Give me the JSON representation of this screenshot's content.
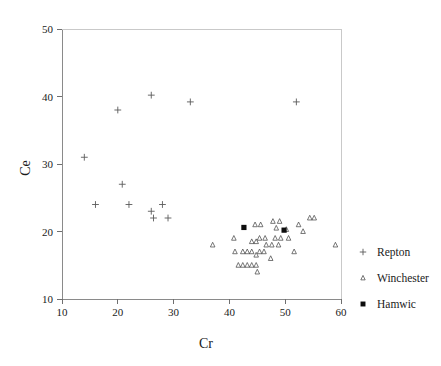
{
  "chart_data": {
    "type": "scatter",
    "title": "",
    "xlabel": "Cr",
    "ylabel": "Ce",
    "xlim": [
      10,
      60
    ],
    "ylim": [
      10,
      50
    ],
    "xticks": [
      10,
      20,
      30,
      40,
      50,
      60
    ],
    "yticks": [
      10,
      20,
      30,
      40,
      50
    ],
    "xtick_labels": [
      "10",
      "20",
      "30",
      "40",
      "50",
      "60"
    ],
    "ytick_labels": [
      "10",
      "20",
      "30",
      "40",
      "50"
    ],
    "grid": false,
    "legend_position": "right",
    "series": [
      {
        "name": "Repton",
        "marker": "plus",
        "color": "#5a5a5a",
        "points": [
          [
            14.0,
            31.0
          ],
          [
            16.0,
            24.0
          ],
          [
            20.0,
            38.0
          ],
          [
            20.8,
            27.0
          ],
          [
            22.0,
            24.0
          ],
          [
            26.0,
            40.2
          ],
          [
            26.0,
            23.0
          ],
          [
            26.4,
            22.0
          ],
          [
            28.0,
            24.0
          ],
          [
            29.0,
            22.0
          ],
          [
            33.0,
            39.2
          ],
          [
            52.0,
            39.2
          ]
        ]
      },
      {
        "name": "Winchester",
        "marker": "triangle",
        "color": "#4a4a4a",
        "points": [
          [
            37.0,
            18.0
          ],
          [
            40.8,
            19.0
          ],
          [
            41.0,
            17.0
          ],
          [
            41.6,
            15.0
          ],
          [
            42.4,
            15.0
          ],
          [
            42.4,
            17.0
          ],
          [
            43.2,
            15.0
          ],
          [
            43.2,
            17.0
          ],
          [
            44.0,
            15.0
          ],
          [
            44.0,
            17.0
          ],
          [
            44.0,
            18.5
          ],
          [
            44.6,
            21.0
          ],
          [
            44.8,
            15.0
          ],
          [
            44.8,
            16.5
          ],
          [
            44.8,
            18.5
          ],
          [
            45.0,
            14.0
          ],
          [
            45.4,
            17.0
          ],
          [
            45.4,
            19.0
          ],
          [
            45.6,
            21.0
          ],
          [
            46.2,
            17.0
          ],
          [
            46.4,
            19.0
          ],
          [
            46.6,
            18.0
          ],
          [
            47.4,
            16.0
          ],
          [
            47.6,
            18.0
          ],
          [
            47.8,
            21.5
          ],
          [
            48.2,
            19.0
          ],
          [
            48.4,
            20.5
          ],
          [
            48.8,
            18.0
          ],
          [
            49.0,
            21.5
          ],
          [
            49.2,
            19.0
          ],
          [
            50.2,
            20.3
          ],
          [
            50.6,
            19.0
          ],
          [
            51.6,
            17.0
          ],
          [
            52.4,
            21.0
          ],
          [
            53.2,
            20.0
          ],
          [
            54.4,
            22.0
          ],
          [
            55.2,
            22.0
          ],
          [
            59.0,
            18.0
          ]
        ]
      },
      {
        "name": "Hamwic",
        "marker": "square",
        "color": "#0d0d0d",
        "points": [
          [
            42.6,
            20.6
          ],
          [
            49.8,
            20.2
          ]
        ]
      }
    ]
  },
  "legend": {
    "entries": [
      {
        "label": "Repton",
        "marker": "plus"
      },
      {
        "label": "Winchester",
        "marker": "triangle"
      },
      {
        "label": "Hamwic",
        "marker": "square"
      }
    ]
  }
}
